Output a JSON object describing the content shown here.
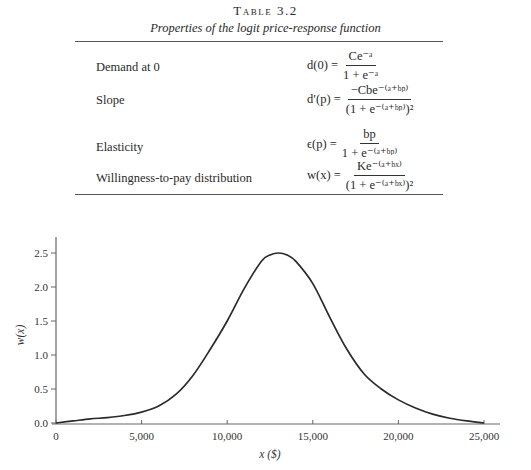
{
  "table": {
    "title": "Table 3.2",
    "subtitle": "Properties of the logit price-response function",
    "rows": [
      {
        "label": "Demand at 0",
        "lhs": "d(0) =",
        "num": "Ce⁻ᵃ",
        "den": "1 + e⁻ᵃ"
      },
      {
        "label": "Slope",
        "lhs": "d′(p) =",
        "num": "−Cbe⁻⁽ᵃ⁺ᵇᵖ⁾",
        "den": "(1 + e⁻⁽ᵃ⁺ᵇᵖ⁾)²"
      },
      {
        "label": "Elasticity",
        "lhs": "ϵ(p) =",
        "num": "bp",
        "den": "1 + e⁻⁽ᵃ⁺ᵇᵖ⁾"
      },
      {
        "label": "Willingness-to-pay distribution",
        "lhs": "w(x) =",
        "num": "Ke⁻⁽ᵃ⁺ᵇˣ⁾",
        "den": "(1 + e⁻⁽ᵃ⁺ᵇˣ⁾)²"
      }
    ]
  },
  "chart_data": {
    "type": "line",
    "title": "",
    "xlabel": "x ($)",
    "ylabel": "w(x)",
    "xlim": [
      0,
      25000
    ],
    "ylim": [
      0,
      2.5
    ],
    "x_ticks": [
      "0",
      "5,000",
      "10,000",
      "15,000",
      "20,000",
      "25,000"
    ],
    "y_ticks": [
      "0.0",
      "0.5",
      "1.0",
      "1.5",
      "2.0",
      "2.5"
    ],
    "grid": false,
    "legend": "none",
    "series": [
      {
        "name": "w(x)",
        "x": [
          0,
          1000,
          2000,
          3000,
          4000,
          5000,
          6000,
          7000,
          8000,
          9000,
          10000,
          11000,
          12000,
          12500,
          13000,
          13500,
          14000,
          15000,
          16000,
          17000,
          18000,
          19000,
          20000,
          21000,
          22000,
          23000,
          24000,
          25000
        ],
        "values": [
          0.0,
          0.03,
          0.06,
          0.08,
          0.11,
          0.16,
          0.25,
          0.42,
          0.7,
          1.08,
          1.5,
          1.98,
          2.38,
          2.47,
          2.5,
          2.47,
          2.38,
          2.05,
          1.55,
          1.08,
          0.72,
          0.5,
          0.34,
          0.22,
          0.13,
          0.07,
          0.03,
          0.0
        ]
      }
    ]
  }
}
